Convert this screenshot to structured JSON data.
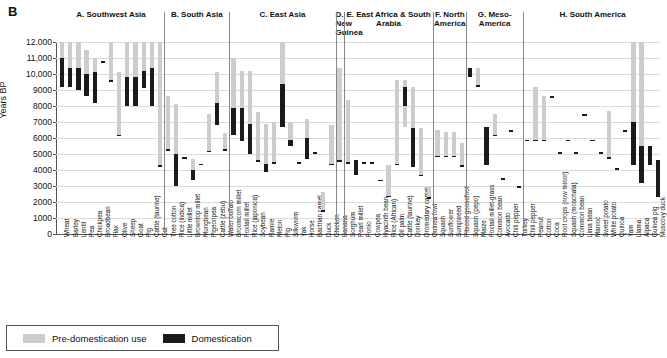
{
  "figure": {
    "panel_letter": "B",
    "ylabel": "Years BP"
  },
  "legend": {
    "items": [
      {
        "label": "Pre-domestication use",
        "color": "#cdcdcd",
        "name": "pre-domestication"
      },
      {
        "label": "Domestication",
        "color": "#1a1a1a",
        "name": "domestication"
      }
    ]
  },
  "chart_data": {
    "type": "bar",
    "title": "B",
    "xlabel": "",
    "ylabel": "Years BP",
    "ylim": [
      0,
      12000
    ],
    "yticks": [
      "0",
      "1000",
      "2000",
      "3000",
      "4000",
      "5000",
      "6000",
      "7000",
      "8000",
      "9000",
      "10,000",
      "11,000",
      "12,000"
    ],
    "grid": true,
    "legend_position": "bottom-left",
    "series": [
      {
        "name": "Pre-domestication use",
        "color": "#cdcdcd"
      },
      {
        "name": "Domestication",
        "color": "#1a1a1a"
      }
    ],
    "panels": [
      {
        "id": "A",
        "title": "A. Southwest Asia",
        "items": [
          {
            "label": "Wheat",
            "pre": [
              10800,
              12000
            ],
            "dom": [
              9200,
              11000
            ]
          },
          {
            "label": "Barley",
            "pre": [
              10400,
              12000
            ],
            "dom": [
              9200,
              10400
            ]
          },
          {
            "label": "Lentil",
            "pre": [
              10400,
              12000
            ],
            "dom": [
              9000,
              10400
            ]
          },
          {
            "label": "Pea",
            "pre": [
              10000,
              11500
            ],
            "dom": [
              8600,
              10000
            ]
          },
          {
            "label": "Chickpea",
            "pre": [
              10100,
              11000
            ],
            "dom": [
              8200,
              10100
            ]
          },
          {
            "label": "Broadbean",
            "pre": [
              10700,
              10800
            ],
            "dom": [
              10700,
              10800
            ]
          },
          {
            "label": "Flax",
            "pre": [
              9500,
              12000
            ],
            "dom": [
              9500,
              9600
            ]
          },
          {
            "label": "Olive",
            "pre": [
              6100,
              10100
            ],
            "dom": [
              6100,
              6200
            ]
          },
          {
            "label": "Sheep",
            "pre": [
              9800,
              12000
            ],
            "dom": [
              8000,
              9800
            ]
          },
          {
            "label": "Goat",
            "pre": [
              9800,
              12000
            ],
            "dom": [
              8000,
              9800
            ]
          },
          {
            "label": "Pig",
            "pre": [
              10200,
              12000
            ],
            "dom": [
              9100,
              10200
            ]
          },
          {
            "label": "Cattle (taurine)",
            "pre": [
              10400,
              12000
            ],
            "dom": [
              8000,
              10400
            ]
          },
          {
            "label": "Cat",
            "pre": [
              4200,
              12000
            ],
            "dom": [
              4200,
              4300
            ]
          }
        ]
      },
      {
        "id": "B",
        "title": "B. South Asia",
        "items": [
          {
            "label": "Tree cotton",
            "pre": [
              5200,
              8600
            ],
            "dom": [
              5200,
              5300
            ]
          },
          {
            "label": "Rice (indica)",
            "pre": [
              5000,
              8100
            ],
            "dom": [
              3000,
              5000
            ]
          },
          {
            "label": "Little millet",
            "pre": [
              4700,
              4800
            ],
            "dom": [
              4700,
              4800
            ]
          },
          {
            "label": "Browntop millet",
            "pre": [
              4000,
              4700
            ],
            "dom": [
              3400,
              4000
            ]
          },
          {
            "label": "Mungbean",
            "pre": [
              4300,
              4400
            ],
            "dom": [
              4300,
              4400
            ]
          },
          {
            "label": "Pigeonpea",
            "pre": [
              5100,
              7500
            ],
            "dom": [
              5100,
              5200
            ]
          },
          {
            "label": "Cattle (zebu)",
            "pre": [
              8200,
              10100
            ],
            "dom": [
              6800,
              8200
            ]
          },
          {
            "label": "Water buffalo",
            "pre": [
              5200,
              6300
            ],
            "dom": [
              5200,
              5300
            ]
          }
        ]
      },
      {
        "id": "C",
        "title": "C. East Asia",
        "items": [
          {
            "label": "Broomcorn millet",
            "pre": [
              7900,
              11000
            ],
            "dom": [
              6200,
              7900
            ]
          },
          {
            "label": "Foxtail millet",
            "pre": [
              7900,
              10200
            ],
            "dom": [
              5800,
              7900
            ]
          },
          {
            "label": "Rice (japonica)",
            "pre": [
              6900,
              10200
            ],
            "dom": [
              5000,
              6900
            ]
          },
          {
            "label": "Soybean",
            "pre": [
              4500,
              7600
            ],
            "dom": [
              4500,
              4600
            ]
          },
          {
            "label": "Ramie",
            "pre": [
              3900,
              6900
            ],
            "dom": [
              3900,
              4400
            ]
          },
          {
            "label": "Melon",
            "pre": [
              4400,
              7000
            ],
            "dom": [
              4400,
              4500
            ]
          },
          {
            "label": "Pig",
            "pre": [
              6700,
              12000
            ],
            "dom": [
              6700,
              9400
            ]
          },
          {
            "label": "Silkworm",
            "pre": [
              5500,
              7000
            ],
            "dom": [
              5500,
              5900
            ]
          },
          {
            "label": "Yak",
            "pre": [
              4400,
              4500
            ],
            "dom": [
              4400,
              4500
            ]
          },
          {
            "label": "Horse",
            "pre": [
              4700,
              7200
            ],
            "dom": [
              4700,
              6000
            ]
          },
          {
            "label": "Bactrian camel",
            "pre": [
              5000,
              5100
            ],
            "dom": [
              5000,
              5100
            ]
          },
          {
            "label": "Duck",
            "pre": [
              1400,
              2600
            ],
            "dom": [
              1400,
              1500
            ]
          },
          {
            "label": "Chicken",
            "pre": [
              4300,
              6800
            ],
            "dom": [
              4300,
              4400
            ]
          }
        ]
      },
      {
        "id": "D",
        "title": "D. New Guinea",
        "items": [
          {
            "label": "Banana",
            "pre": [
              4500,
              10400
            ],
            "dom": [
              4500,
              4600
            ]
          }
        ]
      },
      {
        "id": "E",
        "title": "E. East Africa & South Arabia",
        "items": [
          {
            "label": "Sorghum",
            "pre": [
              4400,
              8400
            ],
            "dom": [
              4400,
              4500
            ]
          },
          {
            "label": "Pearl millet",
            "pre": [
              3700,
              4600
            ],
            "dom": [
              3700,
              4600
            ]
          },
          {
            "label": "Fonio",
            "pre": [
              4400,
              4500
            ],
            "dom": [
              4400,
              4500
            ]
          },
          {
            "label": "Cowpea",
            "pre": [
              4400,
              4500
            ],
            "dom": [
              4400,
              4500
            ]
          },
          {
            "label": "Hyacinth bean",
            "pre": [
              3300,
              3400
            ],
            "dom": [
              3300,
              3400
            ]
          },
          {
            "label": "Rice (African)",
            "pre": [
              2300,
              4300
            ],
            "dom": [
              2300,
              2400
            ]
          },
          {
            "label": "Oil palm",
            "pre": [
              4300,
              9600
            ],
            "dom": [
              4300,
              4400
            ]
          },
          {
            "label": "Cattle (taurine)",
            "pre": [
              6700,
              9600
            ],
            "dom": [
              8000,
              9200
            ]
          },
          {
            "label": "Donkey",
            "pre": [
              4200,
              9200
            ],
            "dom": [
              4200,
              6600
            ]
          },
          {
            "label": "Dromedary camel",
            "pre": [
              3600,
              6600
            ],
            "dom": [
              3600,
              3700
            ]
          },
          {
            "label": "Guinea fowl",
            "pre": [
              2200,
              3000
            ],
            "dom": [
              2200,
              2300
            ]
          }
        ]
      },
      {
        "id": "F",
        "title": "F. North America",
        "items": [
          {
            "label": "Squash",
            "pre": [
              4800,
              6500
            ],
            "dom": [
              4800,
              4900
            ]
          },
          {
            "label": "Sunflower",
            "pre": [
              4800,
              6400
            ],
            "dom": [
              4800,
              4900
            ]
          },
          {
            "label": "Sumpweed",
            "pre": [
              4800,
              6400
            ],
            "dom": [
              4800,
              4900
            ]
          },
          {
            "label": "Pitseed goosefoot",
            "pre": [
              4200,
              5700
            ],
            "dom": [
              4200,
              4300
            ]
          }
        ]
      },
      {
        "id": "G",
        "title": "G. Meso-America",
        "items": [
          {
            "label": "Squash (pepo)",
            "pre": [
              9800,
              10400
            ],
            "dom": [
              9800,
              10400
            ]
          },
          {
            "label": "Maize",
            "pre": [
              9200,
              10400
            ],
            "dom": [
              9200,
              9300
            ]
          },
          {
            "label": "Foxtail millet-grass",
            "pre": [
              4300,
              6700
            ],
            "dom": [
              4300,
              6700
            ]
          },
          {
            "label": "Common bean",
            "pre": [
              6100,
              7500
            ],
            "dom": [
              6100,
              6200
            ]
          },
          {
            "label": "Avocado",
            "pre": [
              3400,
              3500
            ],
            "dom": [
              3400,
              3500
            ]
          },
          {
            "label": "Chili pepper",
            "pre": [
              6400,
              6500
            ],
            "dom": [
              6400,
              6500
            ]
          },
          {
            "label": "Turkey",
            "pre": [
              2900,
              3000
            ],
            "dom": [
              2900,
              3000
            ]
          }
        ]
      },
      {
        "id": "H",
        "title": "H. South America",
        "items": [
          {
            "label": "Chili pepper",
            "pre": [
              5800,
              5900
            ],
            "dom": [
              5800,
              5900
            ]
          },
          {
            "label": "Peanut",
            "pre": [
              5800,
              9200
            ],
            "dom": [
              5800,
              5900
            ]
          },
          {
            "label": "Cotton",
            "pre": [
              5800,
              8600
            ],
            "dom": [
              5800,
              5900
            ]
          },
          {
            "label": "Coca",
            "pre": [
              8500,
              8600
            ],
            "dom": [
              8500,
              8600
            ]
          },
          {
            "label": "Root crops (now minor)",
            "pre": [
              5000,
              5100
            ],
            "dom": [
              5000,
              5100
            ]
          },
          {
            "label": "Squash (moschata)",
            "pre": [
              5800,
              5900
            ],
            "dom": [
              5800,
              5900
            ]
          },
          {
            "label": "Common bean",
            "pre": [
              5000,
              5100
            ],
            "dom": [
              5000,
              5100
            ]
          },
          {
            "label": "Lima bean",
            "pre": [
              7400,
              7500
            ],
            "dom": [
              7400,
              7500
            ]
          },
          {
            "label": "Manioc",
            "pre": [
              5800,
              5900
            ],
            "dom": [
              5800,
              5900
            ]
          },
          {
            "label": "Sweet potato",
            "pre": [
              5000,
              5100
            ],
            "dom": [
              5000,
              5100
            ]
          },
          {
            "label": "White potato",
            "pre": [
              4700,
              7700
            ],
            "dom": [
              4700,
              4800
            ]
          },
          {
            "label": "Quinoa",
            "pre": [
              4000,
              4100
            ],
            "dom": [
              4000,
              4100
            ]
          },
          {
            "label": "Yam",
            "pre": [
              6400,
              6500
            ],
            "dom": [
              6400,
              6500
            ]
          },
          {
            "label": "Llama",
            "pre": [
              4300,
              12000
            ],
            "dom": [
              4300,
              7000
            ]
          },
          {
            "label": "Alpaca",
            "pre": [
              3200,
              12000
            ],
            "dom": [
              3200,
              5500
            ]
          },
          {
            "label": "Guinea pig",
            "pre": [
              4300,
              5500
            ],
            "dom": [
              4300,
              5500
            ]
          },
          {
            "label": "Muscovy duck",
            "pre": [
              2300,
              4600
            ],
            "dom": [
              2300,
              4600
            ]
          }
        ]
      }
    ]
  }
}
